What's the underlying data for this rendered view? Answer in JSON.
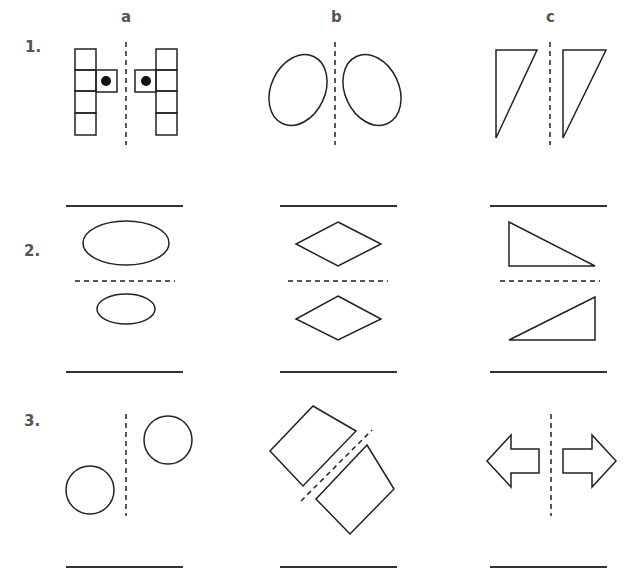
{
  "worksheet": {
    "columns": [
      {
        "label": "a"
      },
      {
        "label": "b"
      },
      {
        "label": "c"
      }
    ],
    "rows": [
      {
        "label": "1.",
        "mirror_axis": "vertical",
        "items": [
          {
            "column": "a",
            "shape": "square-grid-with-dot"
          },
          {
            "column": "b",
            "shape": "tilted-ellipses"
          },
          {
            "column": "c",
            "shape": "right-triangles"
          }
        ]
      },
      {
        "label": "2.",
        "mirror_axis": "horizontal",
        "items": [
          {
            "column": "a",
            "shape": "ellipses-different-size"
          },
          {
            "column": "b",
            "shape": "rhombuses"
          },
          {
            "column": "c",
            "shape": "right-triangles"
          }
        ]
      },
      {
        "label": "3.",
        "mirror_axis": "mixed",
        "items": [
          {
            "column": "a",
            "shape": "offset-circles"
          },
          {
            "column": "b",
            "shape": "rotated-squares-diagonal-axis"
          },
          {
            "column": "c",
            "shape": "opposing-arrows"
          }
        ]
      }
    ]
  },
  "colors": {
    "stroke": "#222222",
    "label": "#555555",
    "answer_line": "#333333"
  }
}
